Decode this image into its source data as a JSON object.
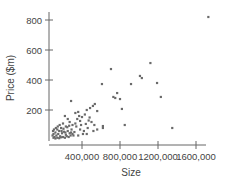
{
  "chart_data": {
    "type": "scatter",
    "title": "",
    "xlabel": "Size",
    "ylabel": "Price ($m)",
    "xlim": [
      50000,
      1700000
    ],
    "ylim": [
      0,
      850
    ],
    "x_ticks": [
      400000,
      800000,
      1200000,
      1600000
    ],
    "x_tick_labels": [
      "400,000",
      "800,000",
      "1200,000",
      "1600,000"
    ],
    "y_ticks": [
      200,
      400,
      600,
      800
    ],
    "y_tick_labels": [
      "200",
      "400",
      "600",
      "800"
    ],
    "grid": false,
    "legend": null,
    "point_color": "#6a6a6a",
    "series": [
      {
        "name": "Price vs Size",
        "points": [
          [
            1730000,
            820
          ],
          [
            1120000,
            513
          ],
          [
            705000,
            473
          ],
          [
            1010000,
            427
          ],
          [
            1030000,
            413
          ],
          [
            1190000,
            380
          ],
          [
            916000,
            373
          ],
          [
            610000,
            373
          ],
          [
            1230000,
            287
          ],
          [
            770000,
            313
          ],
          [
            730000,
            287
          ],
          [
            750000,
            280
          ],
          [
            800000,
            273
          ],
          [
            820000,
            207
          ],
          [
            620000,
            80
          ],
          [
            850000,
            100
          ],
          [
            1350000,
            80
          ],
          [
            285000,
            260
          ],
          [
            450000,
            200
          ],
          [
            485000,
            213
          ],
          [
            515000,
            227
          ],
          [
            535000,
            240
          ],
          [
            560000,
            193
          ],
          [
            330000,
            180
          ],
          [
            360000,
            187
          ],
          [
            400000,
            153
          ],
          [
            380000,
            127
          ],
          [
            440000,
            107
          ],
          [
            530000,
            100
          ],
          [
            620000,
            93
          ],
          [
            320000,
            53
          ],
          [
            250000,
            140
          ],
          [
            270000,
            120
          ],
          [
            300000,
            100
          ],
          [
            340000,
            90
          ],
          [
            380000,
            70
          ],
          [
            420000,
            60
          ],
          [
            460000,
            80
          ],
          [
            500000,
            120
          ],
          [
            480000,
            150
          ],
          [
            430000,
            170
          ],
          [
            410000,
            40
          ],
          [
            360000,
            30
          ],
          [
            220000,
            160
          ],
          [
            200000,
            110
          ],
          [
            230000,
            90
          ],
          [
            180000,
            80
          ],
          [
            160000,
            60
          ],
          [
            140000,
            70
          ],
          [
            120000,
            50
          ],
          [
            100000,
            40
          ],
          [
            90000,
            30
          ],
          [
            110000,
            20
          ],
          [
            130000,
            30
          ],
          [
            150000,
            40
          ],
          [
            170000,
            25
          ],
          [
            190000,
            45
          ],
          [
            210000,
            55
          ],
          [
            230000,
            35
          ],
          [
            250000,
            60
          ],
          [
            270000,
            45
          ],
          [
            290000,
            70
          ],
          [
            310000,
            30
          ],
          [
            95000,
            60
          ],
          [
            105000,
            70
          ],
          [
            125000,
            80
          ],
          [
            145000,
            90
          ],
          [
            165000,
            100
          ],
          [
            185000,
            60
          ],
          [
            205000,
            75
          ],
          [
            225000,
            50
          ],
          [
            245000,
            85
          ],
          [
            265000,
            95
          ],
          [
            285000,
            50
          ],
          [
            100000,
            15
          ],
          [
            120000,
            10
          ],
          [
            140000,
            15
          ],
          [
            160000,
            12
          ],
          [
            180000,
            18
          ],
          [
            200000,
            20
          ],
          [
            220000,
            15
          ],
          [
            240000,
            25
          ],
          [
            260000,
            20
          ],
          [
            280000,
            30
          ],
          [
            300000,
            40
          ],
          [
            330000,
            110
          ],
          [
            350000,
            140
          ],
          [
            370000,
            160
          ],
          [
            390000,
            100
          ],
          [
            470000,
            130
          ],
          [
            520000,
            60
          ],
          [
            560000,
            70
          ],
          [
            450000,
            40
          ]
        ]
      }
    ]
  }
}
